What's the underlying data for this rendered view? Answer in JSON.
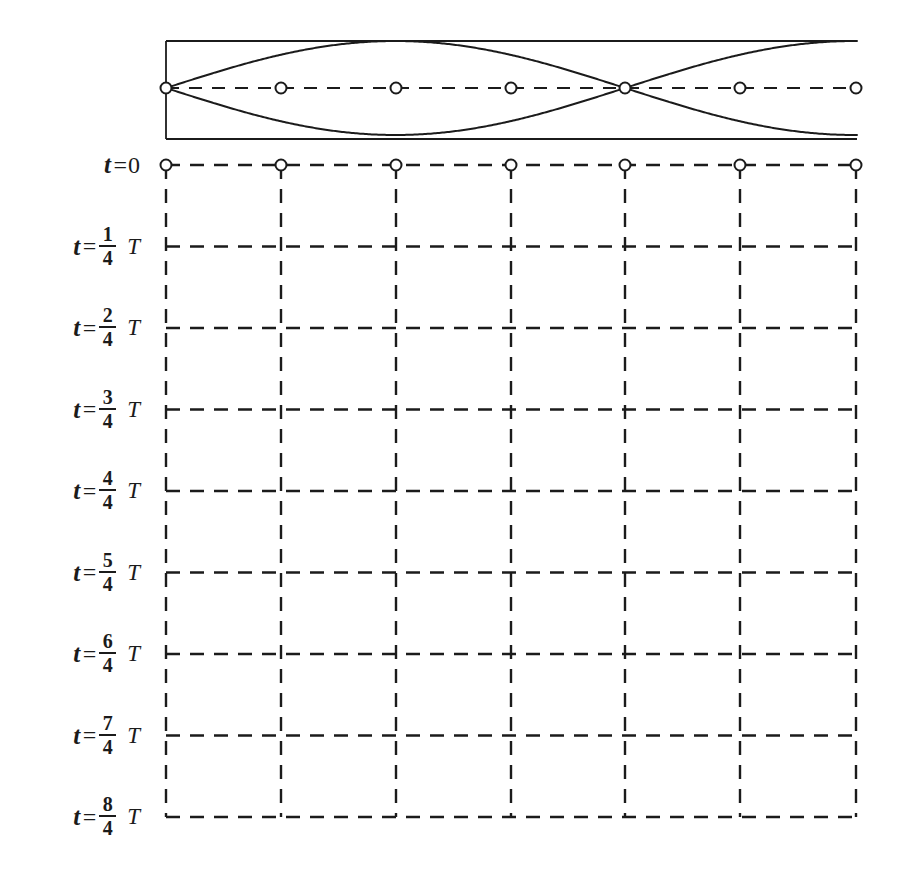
{
  "figure": {
    "kind": "standing-wave-time-series-diagram",
    "ink_color": "#1b1b1b",
    "background_color": "#ffffff",
    "marker_fill": "#ffffff",
    "marker_stroke": "#1b1b1b"
  },
  "envelope_panel": {
    "name": "standing-wave-envelope",
    "box": {
      "x": 166,
      "y": 41,
      "width": 691,
      "height": 98
    },
    "axis_y": 88,
    "description": "Upper and lower sinusoidal envelope curves of a standing wave drawn inside an open-ended rectangle, with a horizontal dashed equilibrium axis.",
    "nodes_x": [
      166,
      281,
      396,
      511,
      625,
      740,
      856
    ],
    "antinodes_x": [
      396,
      740
    ],
    "wave_node_x": [
      166,
      625
    ],
    "amplitude": 47
  },
  "grid": {
    "name": "time-evolution-grid",
    "left": 166,
    "right": 856,
    "top": 165,
    "row_spacing": 81.5,
    "columns_x": [
      166,
      281,
      396,
      511,
      625,
      740,
      856
    ],
    "rows_count": 9,
    "columns_count": 7,
    "dash_pattern": "14 10",
    "stroke_width": 2.4
  },
  "markers": {
    "name": "particle-markers",
    "radius": 5.5,
    "row_index": 0,
    "x_positions": [
      166,
      281,
      396,
      511,
      625,
      740,
      856
    ],
    "envelope_x_positions": [
      166,
      281,
      396,
      511,
      625,
      740,
      856
    ],
    "envelope_y": 88
  },
  "time_labels": [
    {
      "id": "t0",
      "t": "t",
      "eq": "=",
      "numerator": "",
      "denominator": "",
      "value": "0",
      "period": "",
      "y": 165.0
    },
    {
      "id": "t1",
      "t": "t",
      "eq": "=",
      "numerator": "1",
      "denominator": "4",
      "value": "",
      "period": "T",
      "y": 246.5
    },
    {
      "id": "t2",
      "t": "t",
      "eq": "=",
      "numerator": "2",
      "denominator": "4",
      "value": "",
      "period": "T",
      "y": 328.0
    },
    {
      "id": "t3",
      "t": "t",
      "eq": "=",
      "numerator": "3",
      "denominator": "4",
      "value": "",
      "period": "T",
      "y": 409.5
    },
    {
      "id": "t4",
      "t": "t",
      "eq": "=",
      "numerator": "4",
      "denominator": "4",
      "value": "",
      "period": "T",
      "y": 491.0
    },
    {
      "id": "t5",
      "t": "t",
      "eq": "=",
      "numerator": "5",
      "denominator": "4",
      "value": "",
      "period": "T",
      "y": 572.5
    },
    {
      "id": "t6",
      "t": "t",
      "eq": "=",
      "numerator": "6",
      "denominator": "4",
      "value": "",
      "period": "T",
      "y": 654.0
    },
    {
      "id": "t7",
      "t": "t",
      "eq": "=",
      "numerator": "7",
      "denominator": "4",
      "value": "",
      "period": "T",
      "y": 735.5
    },
    {
      "id": "t8",
      "t": "t",
      "eq": "=",
      "numerator": "8",
      "denominator": "4",
      "value": "",
      "period": "T",
      "y": 817.0
    }
  ]
}
